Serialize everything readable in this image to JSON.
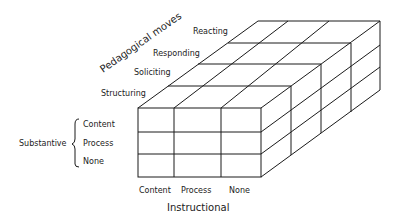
{
  "diagram": {
    "type": "3d-cube-grid",
    "axes": {
      "depth": {
        "title": "Pedagogical moves",
        "categories": [
          "Structuring",
          "Soliciting",
          "Responding",
          "Reacting"
        ]
      },
      "vertical": {
        "title": "Substantive",
        "categories": [
          "Content",
          "Process",
          "None"
        ]
      },
      "horizontal": {
        "title": "Instructional",
        "categories": [
          "Content",
          "Process",
          "None"
        ]
      }
    },
    "colors": {
      "line": "#1a1a1a",
      "text": "#222222",
      "background": "#ffffff"
    }
  }
}
